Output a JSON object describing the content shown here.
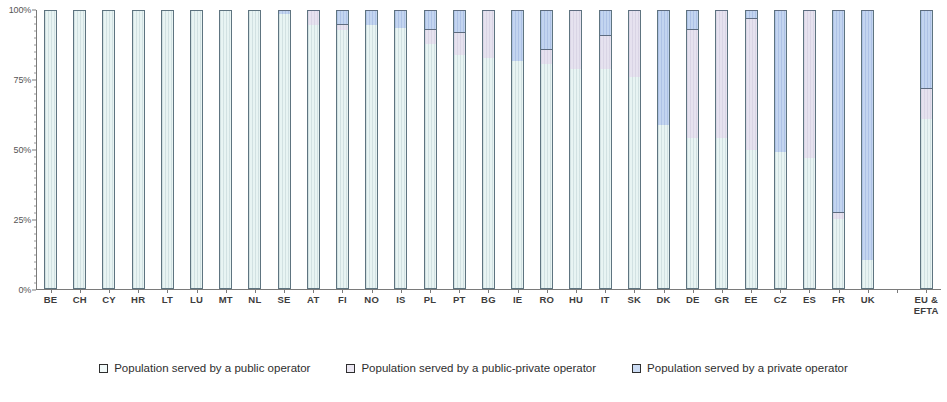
{
  "legend": {
    "items": [
      {
        "key": "public",
        "label": "Population served by a public operator",
        "color": "#e8f4f3"
      },
      {
        "key": "pubpriv",
        "label": "Population served by a public-private operator",
        "color": "#e6e2ef"
      },
      {
        "key": "private",
        "label": "Population served by a private operator",
        "color": "#c3d5f0"
      }
    ]
  },
  "axis": {
    "y_ticks": [
      "0%",
      "25%",
      "50%",
      "75%",
      "100%"
    ],
    "y_tick_values": [
      0,
      25,
      50,
      75,
      100
    ]
  },
  "chart_data": {
    "type": "bar",
    "title": "",
    "xlabel": "",
    "ylabel": "",
    "ylim": [
      0,
      100
    ],
    "grid": false,
    "stacked": true,
    "legend_position": "bottom",
    "categories": [
      "BE",
      "CH",
      "CY",
      "HR",
      "LT",
      "LU",
      "MT",
      "NL",
      "SE",
      "AT",
      "FI",
      "NO",
      "IS",
      "PL",
      "PT",
      "BG",
      "IE",
      "RO",
      "HU",
      "IT",
      "SK",
      "DK",
      "DE",
      "GR",
      "EE",
      "CZ",
      "ES",
      "FR",
      "UK",
      "",
      "EU & EFTA"
    ],
    "series": [
      {
        "name": "Population served by a public operator",
        "values": [
          100,
          100,
          100,
          100,
          100,
          100,
          100,
          100,
          99,
          95,
          93,
          95,
          94,
          88,
          84,
          83,
          82,
          81,
          79,
          79,
          76,
          59,
          54,
          54,
          50,
          49,
          47,
          25,
          10,
          null,
          61
        ]
      },
      {
        "name": "Population served by a public-private operator",
        "values": [
          0,
          0,
          0,
          0,
          0,
          0,
          0,
          0,
          0,
          5,
          2,
          0,
          0,
          5,
          8,
          17,
          0,
          5,
          21,
          12,
          24,
          0,
          39,
          46,
          47,
          0,
          53,
          2,
          0,
          null,
          11
        ]
      },
      {
        "name": "Population served by a private operator",
        "values": [
          0,
          0,
          0,
          0,
          0,
          0,
          0,
          0,
          1,
          0,
          5,
          5,
          6,
          7,
          8,
          0,
          18,
          14,
          0,
          9,
          0,
          41,
          7,
          0,
          3,
          51,
          0,
          73,
          90,
          null,
          28
        ]
      }
    ]
  }
}
